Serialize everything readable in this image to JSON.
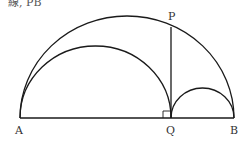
{
  "header": {
    "cut_text": "線, PB"
  },
  "diagram": {
    "labels": {
      "A": "A",
      "Q": "Q",
      "B": "B",
      "P": "P"
    },
    "stroke_color": "#1a1a1a"
  }
}
